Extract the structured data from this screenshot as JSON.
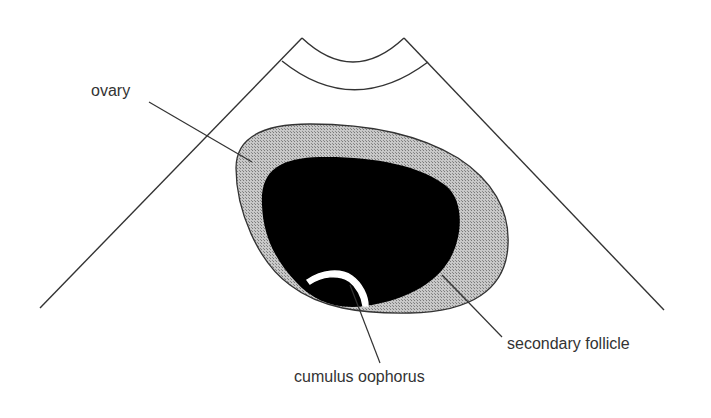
{
  "diagram": {
    "type": "ultrasound-schematic",
    "labels": {
      "ovary": "ovary",
      "secondary_follicle": "secondary follicle",
      "cumulus_oophorus": "cumulus oophorus"
    },
    "colors": {
      "line": "#333333",
      "ovary_fill": "#b4b4b4",
      "follicle_fill": "#000000",
      "cumulus_fill": "#ffffff",
      "background": "#ffffff"
    }
  }
}
